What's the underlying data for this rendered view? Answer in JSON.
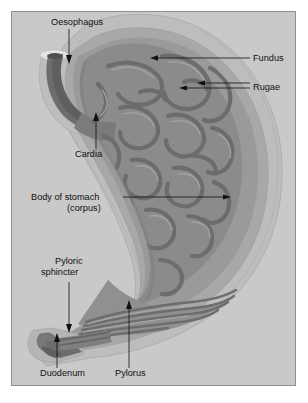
{
  "figure": {
    "panel_background": "#c9c9c9",
    "panel_border": "#8f8f8f",
    "page_background": "#ffffff"
  },
  "palette": {
    "serosa_outer": "#bdbdbd",
    "muscularis": "#a8a8a8",
    "submucosa": "#9a9a9a",
    "mucosa_mid": "#8b8b8b",
    "rugae_dark": "#6d6d6d",
    "lumen_shadow": "#5f5f5f",
    "highlight": "#d6d6d6",
    "outline": "#7a7a7a",
    "label_text": "#101010",
    "leader_line": "#101010"
  },
  "labels": [
    {
      "id": "oesophagus",
      "text": "Oesophagus",
      "text_x": 39,
      "text_y": 13,
      "anchor": "start",
      "leader": "M 57 17 L 57 44",
      "arrow": {
        "x": 57,
        "y": 52,
        "dir": "down"
      }
    },
    {
      "id": "fundus",
      "text": "Fundus",
      "text_x": 241,
      "text_y": 49,
      "anchor": "start",
      "leader": "M 238 46 L 143 46",
      "arrow": {
        "x": 140,
        "y": 46,
        "dir": "left"
      }
    },
    {
      "id": "rugae",
      "text": "Rugae",
      "text_x": 241,
      "text_y": 78,
      "anchor": "start",
      "leader": "M 238 71 L 190 71 M 238 75 L 172 75",
      "arrow": {
        "x": 188,
        "y": 71,
        "dir": "left"
      },
      "arrow2": {
        "x": 170,
        "y": 75,
        "dir": "left"
      }
    },
    {
      "id": "cardia",
      "text": "Cardia",
      "text_x": 63,
      "text_y": 145,
      "anchor": "start",
      "leader": "M 84 137 L 84 108",
      "arrow": {
        "x": 84,
        "y": 100,
        "dir": "up"
      }
    },
    {
      "id": "body-of-stomach",
      "text": "Body of stomach",
      "text2": "(corpus)",
      "text_x": 19,
      "text_y": 188,
      "text2_x": 55,
      "text2_y": 198,
      "anchor": "start",
      "leader": "M 111 185 L 215 185",
      "arrow": {
        "x": 217,
        "y": 185,
        "dir": "right"
      }
    },
    {
      "id": "pyloric-sphincter",
      "text": "Pyloric",
      "text2": "sphincter",
      "text_x": 43,
      "text_y": 252,
      "text2_x": 29,
      "text2_y": 262,
      "anchor": "start",
      "leader": "M 57 270 L 57 313",
      "arrow": {
        "x": 57,
        "y": 321,
        "dir": "down"
      }
    },
    {
      "id": "duodenum",
      "text": "Duodenum",
      "text_x": 28,
      "text_y": 364,
      "anchor": "start",
      "leader": "M 45 355 L 45 327",
      "arrow": {
        "x": 45,
        "y": 322,
        "dir": "up"
      }
    },
    {
      "id": "pylorus",
      "text": "Pylorus",
      "text_x": 103,
      "text_y": 364,
      "anchor": "start",
      "leader": "M 117 355 L 117 295",
      "arrow": {
        "x": 117,
        "y": 289,
        "dir": "up"
      }
    }
  ]
}
